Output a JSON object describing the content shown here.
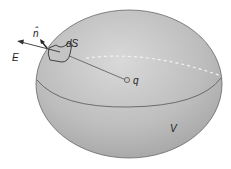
{
  "diagram": {
    "labels": {
      "normal": "n̂",
      "area_element": "dS",
      "field": "E",
      "charge": "q",
      "volume": "V"
    },
    "colors": {
      "surface_fill": "#b8b8b8",
      "surface_highlight": "#d6d6d6",
      "outline": "#555555",
      "background": "#ffffff"
    }
  }
}
